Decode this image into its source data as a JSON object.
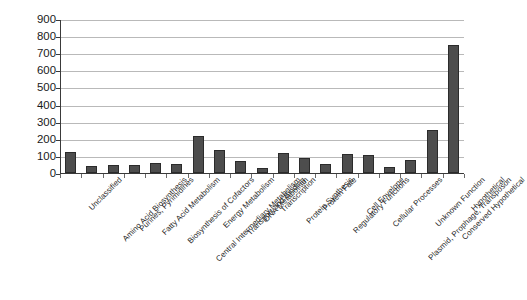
{
  "chart_data": {
    "type": "bar",
    "title": "",
    "subtitle": "",
    "xlabel": "",
    "ylabel": "",
    "ylim": [
      0,
      900
    ],
    "ytick_step": 100,
    "yticks": [
      900,
      800,
      700,
      600,
      500,
      400,
      300,
      200,
      100,
      0
    ],
    "grid": true,
    "legend": false,
    "legend_position": "none",
    "bar_color": "#4d4d4d",
    "bar_edge_color": "#2b2b2b",
    "gridline_color": "#b9b9b9",
    "axis_color": "#3a3a3a",
    "background_color": "#ffffff",
    "categories": [
      "Unclassified",
      "Amino Acid Biosynthesis",
      "Purines, Pyrimidines",
      "Fatty Acid Metabolism",
      "Biosynthesis of Cofactors",
      "Central Intermediary Metabolism",
      "Energy Metabolism",
      "Transport and Binding",
      "DNA Metabolism",
      "Transcription",
      "Protein Synthesis",
      "Protein Fate",
      "Regulatory Functions",
      "Cell Envelope",
      "Cellular Processes",
      "Plasmid, Prophage, Transposon",
      "Unknown Function",
      "Conserved Hypothetical",
      "Hypothetical"
    ],
    "values": [
      120,
      40,
      45,
      45,
      60,
      50,
      215,
      135,
      70,
      30,
      115,
      85,
      50,
      110,
      105,
      35,
      75,
      250,
      750
    ]
  }
}
